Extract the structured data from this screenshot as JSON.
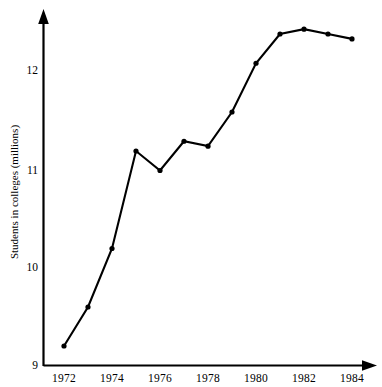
{
  "chart_data": {
    "type": "line",
    "title": "",
    "subtitle": "",
    "xlabel": "",
    "ylabel": "Students in colleges (millions)",
    "x": [
      1972,
      1973,
      1974,
      1975,
      1976,
      1977,
      1978,
      1979,
      1980,
      1981,
      1982,
      1983,
      1984
    ],
    "values": [
      9.2,
      9.6,
      10.2,
      11.2,
      11.0,
      11.3,
      11.25,
      11.6,
      12.1,
      12.4,
      12.45,
      12.4,
      12.35
    ],
    "series": [
      {
        "name": "Students in colleges",
        "values": [
          9.2,
          9.6,
          10.2,
          11.2,
          11.0,
          11.3,
          11.25,
          11.6,
          12.1,
          12.4,
          12.45,
          12.4,
          12.35
        ]
      }
    ],
    "xlim": [
      1971.5,
      1984.8
    ],
    "ylim": [
      9.0,
      12.62
    ],
    "xticks": [
      1972,
      1974,
      1976,
      1978,
      1980,
      1982,
      1984
    ],
    "xtick_labels": [
      "1972",
      "1974",
      "1976",
      "1978",
      "1980",
      "1982",
      "1984"
    ],
    "yticks": [
      9,
      10,
      11,
      12
    ],
    "ytick_labels": [
      "9",
      "10",
      "11",
      "12"
    ],
    "grid": false,
    "legend": false,
    "legend_position": "none",
    "marker": "filled-circle",
    "line_color": "#000000",
    "marker_color": "#000000",
    "background_color": "#ffffff",
    "axis_style": "arrow-tipped-L-spines",
    "annotations": []
  }
}
